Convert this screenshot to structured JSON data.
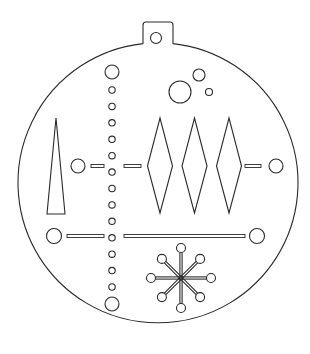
{
  "diagram": {
    "title": "Christmas ornament cut-out template",
    "line_color": "#2b2b2b",
    "background": "#ffffff",
    "elements": {
      "outline": "round ornament with hanger tab",
      "hanger_hole": "circle",
      "dot_column": {
        "small_dots": 13,
        "end_circles": 2
      },
      "bubbles": 3,
      "triangle": 1,
      "diamonds": 3,
      "side_circles": 4,
      "slots": 5,
      "snowflake": {
        "arms": 8,
        "knobs": 8
      }
    }
  }
}
